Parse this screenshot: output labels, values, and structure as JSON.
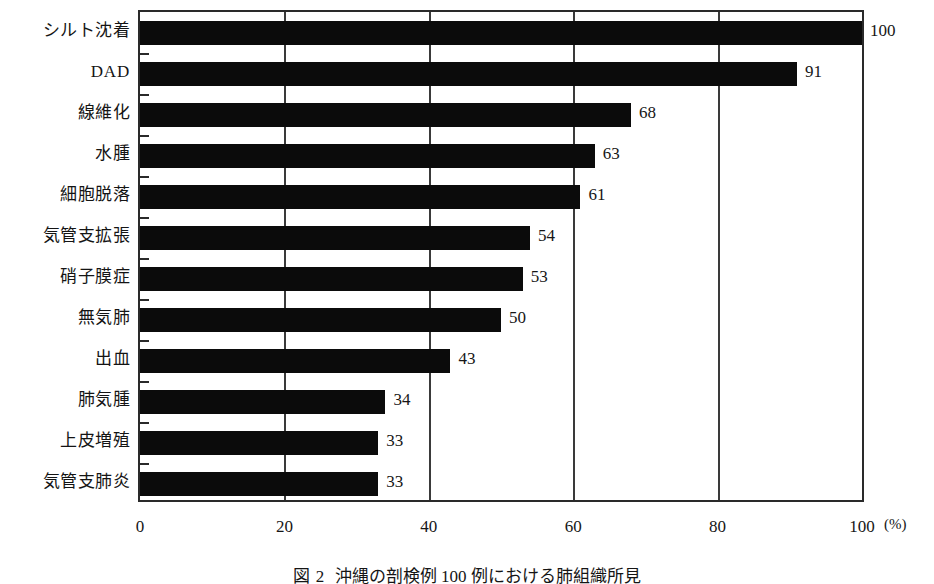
{
  "chart_data": {
    "type": "bar",
    "orientation": "horizontal",
    "title": "",
    "xlabel": "(%)",
    "ylabel": "",
    "xlim": [
      0,
      100
    ],
    "xticks": [
      0,
      20,
      40,
      60,
      80,
      100
    ],
    "grid": "vertical gridlines at 20, 40, 60, 80",
    "legend": "none",
    "bar_color": "#0b0b0b",
    "background_color": "#ffffff",
    "categories": [
      "シルト沈着",
      "DAD",
      "線維化",
      "水腫",
      "細胞脱落",
      "気管支拡張",
      "硝子膜症",
      "無気肺",
      "出血",
      "肺気腫",
      "上皮増殖",
      "気管支肺炎"
    ],
    "values": [
      100,
      91,
      68,
      63,
      61,
      54,
      53,
      50,
      43,
      34,
      33,
      33
    ],
    "value_labels": [
      "100",
      "91",
      "68",
      "63",
      "61",
      "54",
      "53",
      "50",
      "43",
      "34",
      "33",
      "33"
    ],
    "xtick_labels": [
      "0",
      "20",
      "40",
      "60",
      "80",
      "100"
    ],
    "unit": "(%)"
  },
  "caption": {
    "number": "図 2",
    "text": "沖縄の剖検例 100 例における肺組織所見"
  }
}
